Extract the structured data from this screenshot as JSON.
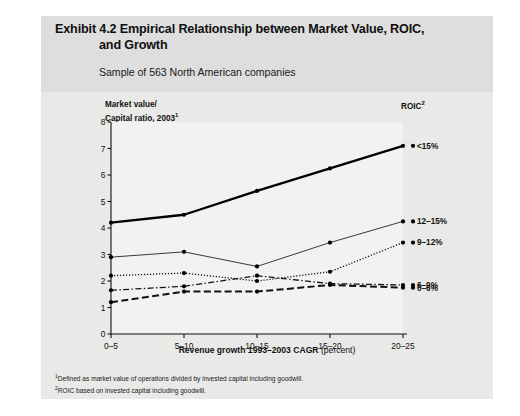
{
  "exhibit": {
    "title_line1": "Exhibit 4.2 Empirical Relationship between Market Value, ROIC,",
    "title_line2": "and Growth",
    "subtitle": "Sample of 563 North American companies",
    "legend_header": "ROIC",
    "legend_header_sup": "2",
    "footnote_1_marker": "1",
    "footnote_1": "Defined as market value of operations divided by invested capital including goodwill.",
    "footnote_2_marker": "2",
    "footnote_2": "ROIC based on invested capital including goodwill."
  },
  "chart_data": {
    "type": "line",
    "title": "Exhibit 4.2 Empirical Relationship between Market Value, ROIC, and Growth",
    "subtitle": "Sample of 563 North American companies",
    "ylabel_line1": "Market value/",
    "ylabel_line2": "Capital ratio, 2003",
    "ylabel_sup": "1",
    "xlabel_bold": "Revenue growth 1993–2003 CAGR",
    "xlabel_plain": " (percent)",
    "categories": [
      "0–5",
      "5–10",
      "10–15",
      "15–20",
      "20–25"
    ],
    "yticks": [
      0,
      1,
      2,
      3,
      4,
      5,
      6,
      7,
      8
    ],
    "ylim": [
      0,
      8
    ],
    "grid": false,
    "legend_position": "right-inline",
    "series": [
      {
        "name": "<15%",
        "values": [
          4.2,
          4.5,
          5.4,
          6.25,
          7.1
        ],
        "style": "solid-thick",
        "color": "#000000"
      },
      {
        "name": "12–15%",
        "values": [
          2.9,
          3.1,
          2.55,
          3.45,
          4.25
        ],
        "style": "solid-thin",
        "color": "#3a3a3a"
      },
      {
        "name": "9–12%",
        "values": [
          2.2,
          2.3,
          2.0,
          2.35,
          3.45
        ],
        "style": "dotted",
        "color": "#111111"
      },
      {
        "name": "6–9%",
        "values": [
          1.65,
          1.8,
          2.2,
          1.9,
          1.85
        ],
        "style": "dash-dot",
        "color": "#111111"
      },
      {
        "name": "0–6%",
        "values": [
          1.2,
          1.6,
          1.6,
          1.85,
          1.75
        ],
        "style": "dashed",
        "color": "#111111"
      }
    ]
  }
}
